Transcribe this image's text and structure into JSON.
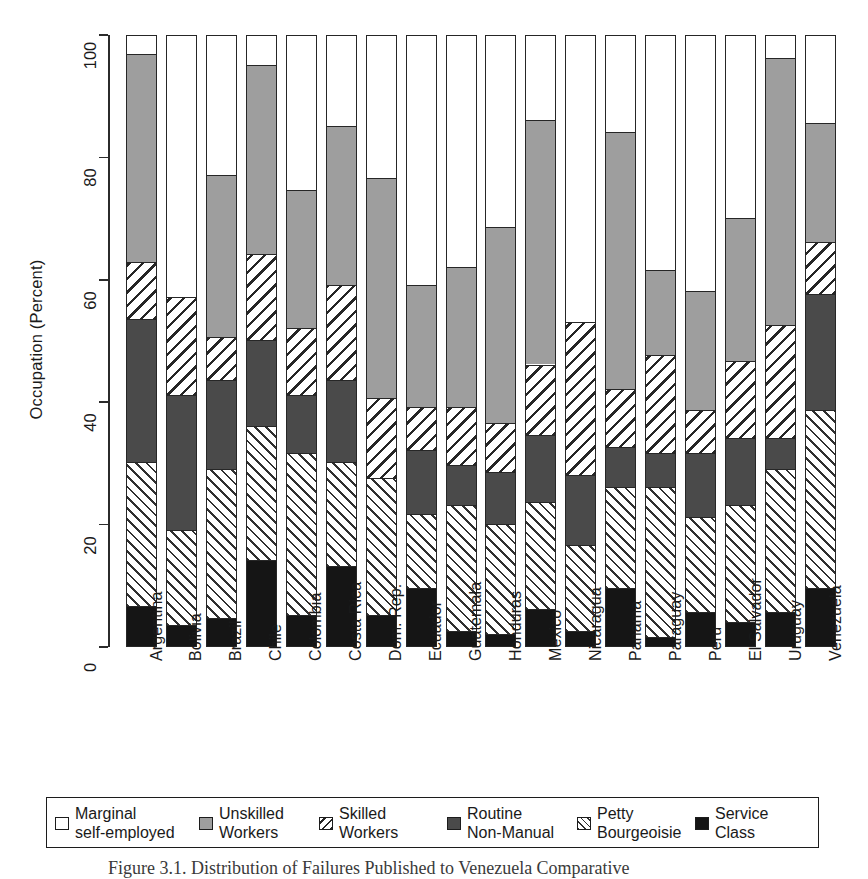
{
  "figure": {
    "ylabel": "Occupation (Percent)",
    "caption": "Figure 3.1.  Distribution of Failures Published to Venezuela Comparative"
  },
  "chart_data": {
    "type": "bar",
    "stacked": true,
    "title": "",
    "xlabel": "",
    "ylabel": "Occupation (Percent)",
    "ylim": [
      0,
      100
    ],
    "yticks": [
      0,
      20,
      40,
      60,
      80,
      100
    ],
    "grid": false,
    "legend_position": "bottom",
    "categories": [
      "Argentina",
      "Bolivia",
      "Brazil",
      "Chile",
      "Colombia",
      "Costa Rica",
      "Dom. Rep.",
      "Ecuador",
      "Guatemala",
      "Honduras",
      "Mexico",
      "Nicaragua",
      "Panama",
      "Paraguay",
      "Peru",
      "El Salvador",
      "Uruguay",
      "Venezuela"
    ],
    "series": [
      {
        "name": "Service Class",
        "pattern": "solid-black",
        "color": "#151515",
        "values": [
          6.5,
          3.5,
          4.5,
          14.0,
          5.0,
          13.0,
          5.0,
          9.5,
          2.5,
          2.0,
          6.0,
          2.5,
          9.5,
          1.5,
          5.5,
          4.0,
          5.5,
          9.5
        ]
      },
      {
        "name": "Petty Bourgeoisie",
        "pattern": "hatch-forward-thin",
        "color": "#303030",
        "values": [
          23.5,
          15.5,
          24.5,
          22.0,
          26.5,
          17.0,
          22.5,
          12.0,
          20.5,
          18.0,
          17.5,
          14.0,
          16.5,
          24.5,
          15.5,
          19.0,
          23.5,
          29.0
        ]
      },
      {
        "name": "Routine Non-Manual",
        "pattern": "solid-dark-gray",
        "color": "#4a4a4a",
        "values": [
          23.5,
          22.0,
          14.5,
          14.0,
          9.5,
          13.5,
          0.0,
          10.5,
          6.5,
          8.5,
          11.0,
          11.5,
          6.5,
          5.5,
          10.5,
          11.0,
          5.0,
          19.0
        ]
      },
      {
        "name": "Skilled Workers",
        "pattern": "hatch-back-thick",
        "color": "#262626",
        "values": [
          9.3,
          16.0,
          7.0,
          14.0,
          11.0,
          15.5,
          13.0,
          7.0,
          9.5,
          8.0,
          11.5,
          25.0,
          9.5,
          16.0,
          7.0,
          12.5,
          18.5,
          8.5
        ]
      },
      {
        "name": "Unskilled Workers",
        "pattern": "solid-light-gray",
        "color": "#9e9e9e",
        "values": [
          34.0,
          0.0,
          26.5,
          31.0,
          22.5,
          26.0,
          36.0,
          20.0,
          23.0,
          32.0,
          40.0,
          0.0,
          42.0,
          14.0,
          19.5,
          23.5,
          43.5,
          19.5
        ]
      },
      {
        "name": "Marginal self-employed",
        "pattern": "white",
        "color": "#ffffff",
        "values": [
          3.2,
          43.0,
          23.0,
          5.0,
          25.5,
          15.0,
          23.5,
          41.0,
          38.0,
          31.5,
          14.0,
          47.0,
          16.0,
          38.5,
          42.0,
          30.0,
          4.0,
          14.5
        ]
      }
    ],
    "cumulative_tops": {
      "note": "Top edge of each stacked segment, bottom to top, per country",
      "Argentina": [
        6.5,
        30.0,
        53.5,
        62.8,
        96.8,
        100
      ],
      "Bolivia": [
        3.5,
        19.0,
        41.0,
        57.0,
        57.0,
        100
      ],
      "Brazil": [
        4.5,
        29.0,
        43.5,
        50.5,
        77.0,
        100
      ],
      "Chile": [
        14.0,
        36.0,
        50.0,
        64.0,
        95.0,
        100
      ],
      "Colombia": [
        5.0,
        31.5,
        41.0,
        52.0,
        74.5,
        100
      ],
      "Costa Rica": [
        13.0,
        30.0,
        43.5,
        59.0,
        85.0,
        100
      ],
      "Dom. Rep.": [
        5.0,
        27.5,
        27.5,
        40.5,
        76.5,
        100
      ],
      "Ecuador": [
        9.5,
        21.5,
        32.0,
        39.0,
        59.0,
        100
      ],
      "Guatemala": [
        2.5,
        23.0,
        29.5,
        39.0,
        62.0,
        100
      ],
      "Honduras": [
        2.0,
        20.0,
        28.5,
        36.5,
        68.5,
        100
      ],
      "Mexico": [
        6.0,
        23.5,
        34.5,
        46.0,
        86.0,
        100
      ],
      "Nicaragua": [
        2.5,
        16.5,
        28.0,
        53.0,
        53.0,
        100
      ],
      "Panama": [
        9.5,
        26.0,
        32.5,
        42.0,
        84.0,
        100
      ],
      "Paraguay": [
        1.5,
        26.0,
        31.5,
        47.5,
        61.5,
        100
      ],
      "Peru": [
        5.5,
        21.0,
        31.5,
        38.5,
        58.0,
        100
      ],
      "El Salvador": [
        4.0,
        23.0,
        34.0,
        46.5,
        70.0,
        100
      ],
      "Uruguay": [
        5.5,
        29.0,
        34.0,
        52.5,
        96.0,
        100
      ],
      "Venezuela": [
        9.5,
        38.5,
        57.5,
        66.0,
        85.5,
        100
      ]
    },
    "legend": [
      {
        "label": "Marginal\nself-employed",
        "swatch": "white"
      },
      {
        "label": "Unskilled\nWorkers",
        "swatch": "solid-light-gray"
      },
      {
        "label": "Skilled\nWorkers",
        "swatch": "hatch-back-thick"
      },
      {
        "label": "Routine\nNon-Manual",
        "swatch": "solid-dark-gray"
      },
      {
        "label": "Petty\nBourgeoisie",
        "swatch": "hatch-forward-thin"
      },
      {
        "label": "Service\nClass",
        "swatch": "solid-black"
      }
    ]
  }
}
